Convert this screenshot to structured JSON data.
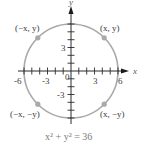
{
  "diagram": {
    "type": "circle-on-coordinate-plane",
    "axes": {
      "x_label": "x",
      "y_label": "y",
      "x_tick_labels": [
        "-6",
        "-3",
        "0",
        "3",
        "6"
      ],
      "y_tick_labels": [
        "3",
        "-3"
      ],
      "range": [
        -6,
        6
      ],
      "tick_step": 1
    },
    "circle": {
      "center": [
        0,
        0
      ],
      "radius": 6,
      "color": "#a9a9a9"
    },
    "points": [
      {
        "label": "(−x, y)",
        "quadrant": 2
      },
      {
        "label": "(x, y)",
        "quadrant": 1
      },
      {
        "label": "(−x, −y)",
        "quadrant": 3
      },
      {
        "label": "(x, −y)",
        "quadrant": 4
      }
    ],
    "point_color": "#a9a9a9",
    "equation": "x² + y² = 36"
  }
}
